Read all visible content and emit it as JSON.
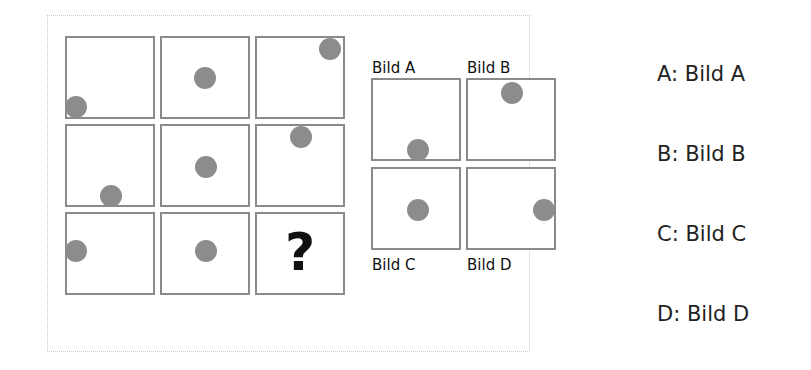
{
  "puzzle": {
    "missing_symbol": "?",
    "grid": [
      {
        "row": 0,
        "col": 0,
        "dot": {
          "x": -8,
          "y": 58
        }
      },
      {
        "row": 0,
        "col": 1,
        "dot": {
          "x": 33,
          "y": 29
        }
      },
      {
        "row": 0,
        "col": 2,
        "dot": {
          "x": 63,
          "y": -1
        }
      },
      {
        "row": 1,
        "col": 0,
        "dot": {
          "x": 33,
          "y": 60
        }
      },
      {
        "row": 1,
        "col": 1,
        "dot": {
          "x": 33,
          "y": 30
        }
      },
      {
        "row": 1,
        "col": 2,
        "dot": {
          "x": 33,
          "y": 0
        }
      },
      {
        "row": 2,
        "col": 0,
        "dot": {
          "x": -8,
          "y": 26
        }
      },
      {
        "row": 2,
        "col": 1,
        "dot": {
          "x": 33,
          "y": 26
        }
      },
      {
        "row": 2,
        "col": 2,
        "dot": null
      }
    ]
  },
  "options": {
    "a": {
      "label": "Bild A"
    },
    "b": {
      "label": "Bild B"
    },
    "c": {
      "label": "Bild C"
    },
    "d": {
      "label": "Bild D"
    }
  },
  "answers": [
    {
      "text": "A: Bild A"
    },
    {
      "text": "B: Bild B"
    },
    {
      "text": "C: Bild C"
    },
    {
      "text": "D: Bild D"
    }
  ]
}
